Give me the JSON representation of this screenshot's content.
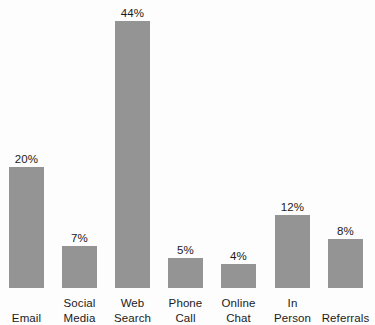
{
  "chart_data": {
    "type": "bar",
    "title": "",
    "subtitle": "",
    "xlabel": "",
    "ylabel": "",
    "ylim": [
      0,
      44
    ],
    "grid": false,
    "legend": "none",
    "value_suffix": "%",
    "bar_color": "#949494",
    "background_color": "#fdfdfd",
    "text_color": "#1b1b1b",
    "categories": [
      "Email",
      "Social Media",
      "Web Search",
      "Phone Call",
      "Online Chat",
      "In Person",
      "Referrals"
    ],
    "values": [
      20,
      7,
      44,
      5,
      4,
      12,
      8
    ],
    "bars": [
      {
        "category": "Email",
        "label_lines": [
          "Email"
        ],
        "value": 20,
        "value_label": "20%"
      },
      {
        "category": "Social Media",
        "label_lines": [
          "Social",
          "Media"
        ],
        "value": 7,
        "value_label": "7%"
      },
      {
        "category": "Web Search",
        "label_lines": [
          "Web",
          "Search"
        ],
        "value": 44,
        "value_label": "44%"
      },
      {
        "category": "Phone Call",
        "label_lines": [
          "Phone",
          "Call"
        ],
        "value": 5,
        "value_label": "5%"
      },
      {
        "category": "Online Chat",
        "label_lines": [
          "Online",
          "Chat"
        ],
        "value": 4,
        "value_label": "4%"
      },
      {
        "category": "In Person",
        "label_lines": [
          "In",
          "Person"
        ],
        "value": 12,
        "value_label": "12%"
      },
      {
        "category": "Referrals",
        "label_lines": [
          "Referrals"
        ],
        "value": 8,
        "value_label": "8%"
      }
    ]
  }
}
